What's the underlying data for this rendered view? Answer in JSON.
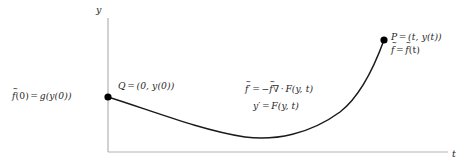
{
  "figure": {
    "background_color": "#ffffff",
    "axis_color": "#b3b3b3",
    "curve_color": "#1a1a1a",
    "point_color": "#000000",
    "text_color": "#1f1f1f"
  },
  "axes": {
    "y_axis_label": "y",
    "t_axis_label": "t",
    "origin_px": [
      108,
      152
    ],
    "y_axis_top_px": [
      108,
      18
    ],
    "t_axis_right_px": [
      448,
      152
    ]
  },
  "points": [
    {
      "id": "Q",
      "label": "Q = (0, y(0))",
      "label_parts": {
        "name": "Q",
        "equals": "=",
        "value": "(0, y(0))"
      },
      "px": [
        108,
        97
      ]
    },
    {
      "id": "P",
      "label": "P = (t, y(t))",
      "label_parts": {
        "name": "P",
        "equals": "=",
        "value": "(t, y(t))"
      },
      "px": [
        384,
        40
      ]
    }
  ],
  "annotations": {
    "initial_condition": {
      "text": "f̃(0) = g(y(0))",
      "lhs_fn": "f",
      "lhs_arg": "(0)",
      "equals": "=",
      "rhs": "g(y(0))"
    },
    "ftilde_at_t": {
      "text": "f̃ = f̃(t)",
      "lhs_fn": "f",
      "equals": "=",
      "rhs_fn": "f",
      "rhs_arg": "(t)"
    },
    "equation_density": {
      "text": "f̃′ = −f̃∇ · F(y, t)",
      "lhs_fn": "f",
      "lhs_prime": "′",
      "equals": "=",
      "minus": "−",
      "rhs_fn": "f",
      "nabla": "∇",
      "dot": "·",
      "field": "F(y, t)"
    },
    "equation_state": {
      "text": "y′ = F(y, t)",
      "lhs": "y",
      "lhs_prime": "′",
      "equals": "=",
      "rhs": "F(y, t)"
    }
  },
  "curve": {
    "description": "Trajectory descending from Q to a minimum then rising steeply to P",
    "path_d": "M 108 97 C 150 110, 200 130, 245 137 C 275 141, 310 134, 340 112 C 362 95, 376 62, 384 40",
    "minimum_px": [
      262,
      138
    ],
    "stroke_width": 1.5
  }
}
